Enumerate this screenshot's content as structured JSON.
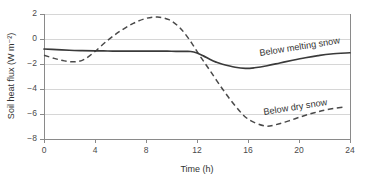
{
  "chart_data": {
    "type": "line",
    "title": "",
    "xlabel": "Time (h)",
    "ylabel": "Soil heat flux (W m⁻²)",
    "xlim": [
      0,
      24
    ],
    "ylim": [
      -8,
      2
    ],
    "xticks": [
      "0",
      "4",
      "8",
      "12",
      "16",
      "20",
      "24"
    ],
    "xtick_values": [
      0,
      4,
      8,
      12,
      16,
      20,
      24
    ],
    "yticks": [
      "2",
      "0",
      "−2",
      "−4",
      "−6",
      "−8"
    ],
    "ytick_values": [
      2,
      0,
      -2,
      -4,
      -6,
      -8
    ],
    "grid": "horizontal",
    "legend_position": "inline-annotations",
    "series": [
      {
        "name": "Below melting snow",
        "style": "solid",
        "color": "#3a3a3a",
        "annotation": "Below melting snow",
        "annotation_rotation_deg": -9,
        "x": [
          0,
          1,
          2,
          3,
          4,
          5,
          6,
          7,
          8,
          9,
          10,
          11,
          11.5,
          12,
          12.5,
          13,
          13.5,
          14,
          15,
          15.8,
          16.5,
          17.5,
          18.5,
          19.5,
          20.5,
          21.5,
          22.5,
          24
        ],
        "values": [
          -0.8,
          -0.85,
          -0.9,
          -0.93,
          -0.95,
          -0.96,
          -0.97,
          -0.97,
          -0.97,
          -0.97,
          -0.98,
          -0.99,
          -1.0,
          -1.12,
          -1.35,
          -1.62,
          -1.85,
          -2.02,
          -2.26,
          -2.35,
          -2.3,
          -2.14,
          -1.92,
          -1.7,
          -1.5,
          -1.33,
          -1.2,
          -1.1
        ]
      },
      {
        "name": "Below dry snow",
        "style": "dashed",
        "color": "#4a4a4a",
        "annotation": "Below dry snow",
        "annotation_rotation_deg": -9,
        "x": [
          0,
          0.8,
          1.6,
          2.5,
          3.2,
          4,
          5,
          6,
          7,
          8,
          8.9,
          9.8,
          10.5,
          11,
          11.6,
          12.2,
          13,
          14,
          15,
          16,
          17.3,
          18.2,
          19.2,
          20.2,
          21.2,
          22.2,
          23.5
        ],
        "values": [
          -1.3,
          -1.55,
          -1.75,
          -1.82,
          -1.6,
          -1.0,
          -0.1,
          0.65,
          1.25,
          1.65,
          1.76,
          1.55,
          1.05,
          0.5,
          -0.35,
          -1.3,
          -2.5,
          -4.0,
          -5.35,
          -6.4,
          -6.95,
          -6.85,
          -6.55,
          -6.2,
          -5.9,
          -5.65,
          -5.45
        ]
      }
    ],
    "annotations": [
      {
        "text": "Below melting snow",
        "x_h": 20.3,
        "y_flux": -1.35
      },
      {
        "text": "Below dry snow",
        "x_h": 21.1,
        "y_flux": -6.05
      }
    ]
  }
}
